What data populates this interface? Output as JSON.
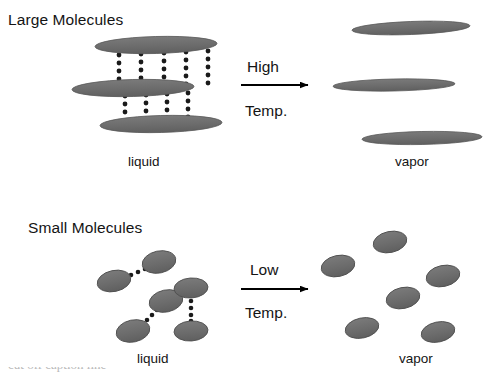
{
  "figure": {
    "background_color": "#ffffff",
    "molecule_fill": "#6e6e6e",
    "molecule_stroke": "#4a4a4a",
    "bond_dot_color": "#1a1a1a",
    "arrow_color": "#000000",
    "text_color": "#141414"
  },
  "panels": [
    {
      "id": "large-molecules",
      "title": "Large Molecules",
      "liquid_label": "liquid",
      "vapor_label": "vapor",
      "arrow": {
        "label_top": "High",
        "label_bottom": "Temp.",
        "direction": "right"
      },
      "liquid_molecules": [
        {
          "cx": 156,
          "cy": 45,
          "rx": 61,
          "ry": 8.5,
          "rotate": -1.5
        },
        {
          "cx": 133,
          "cy": 88,
          "rx": 61,
          "ry": 8.5,
          "rotate": -1.5
        },
        {
          "cx": 161,
          "cy": 124,
          "rx": 61,
          "ry": 8.5,
          "rotate": -1.5
        }
      ],
      "bond_columns_upper": [
        119,
        142,
        164,
        186,
        208
      ],
      "bond_columns_lower": [
        125,
        146,
        167,
        188
      ],
      "vapor_molecules": [
        {
          "cx": 411,
          "cy": 28,
          "rx": 59,
          "ry": 6.5,
          "rotate": -2.2
        },
        {
          "cx": 394,
          "cy": 85,
          "rx": 61,
          "ry": 6.0,
          "rotate": -1.2
        },
        {
          "cx": 422,
          "cy": 138,
          "rx": 60,
          "ry": 6.5,
          "rotate": -1.2
        }
      ]
    },
    {
      "id": "small-molecules",
      "title": "Small Molecules",
      "liquid_label": "liquid",
      "vapor_label": "vapor",
      "arrow": {
        "label_top": "Low",
        "label_bottom": "Temp.",
        "direction": "right"
      },
      "liquid_molecules": [
        {
          "cx": 114,
          "cy": 281,
          "rx": 17,
          "ry": 10.5,
          "rotate": -12
        },
        {
          "cx": 159,
          "cy": 262,
          "rx": 17,
          "ry": 11,
          "rotate": -12
        },
        {
          "cx": 166,
          "cy": 301,
          "rx": 17,
          "ry": 11,
          "rotate": -12
        },
        {
          "cx": 133,
          "cy": 331,
          "rx": 17,
          "ry": 11,
          "rotate": -12
        },
        {
          "cx": 191,
          "cy": 288,
          "rx": 17,
          "ry": 10,
          "rotate": -4
        },
        {
          "cx": 191,
          "cy": 331,
          "rx": 17,
          "ry": 10,
          "rotate": -4
        }
      ],
      "liquid_bonds": [
        {
          "x1": 128,
          "y1": 276,
          "x2": 148,
          "y2": 266
        },
        {
          "x1": 152,
          "y1": 312,
          "x2": 144,
          "y2": 325
        },
        {
          "x1": 191,
          "y1": 301,
          "x2": 191,
          "y2": 320
        }
      ],
      "vapor_molecules": [
        {
          "cx": 390,
          "cy": 242,
          "rx": 17,
          "ry": 10.5,
          "rotate": -12
        },
        {
          "cx": 338,
          "cy": 266,
          "rx": 17,
          "ry": 10.5,
          "rotate": -12
        },
        {
          "cx": 443,
          "cy": 276,
          "rx": 17,
          "ry": 10.5,
          "rotate": -12
        },
        {
          "cx": 403,
          "cy": 298,
          "rx": 17,
          "ry": 10.5,
          "rotate": -12
        },
        {
          "cx": 362,
          "cy": 328,
          "rx": 17,
          "ry": 10,
          "rotate": -12
        },
        {
          "cx": 438,
          "cy": 332,
          "rx": 17,
          "ry": 10,
          "rotate": -12
        }
      ]
    }
  ],
  "caption": {
    "text": "cut off caption line"
  }
}
